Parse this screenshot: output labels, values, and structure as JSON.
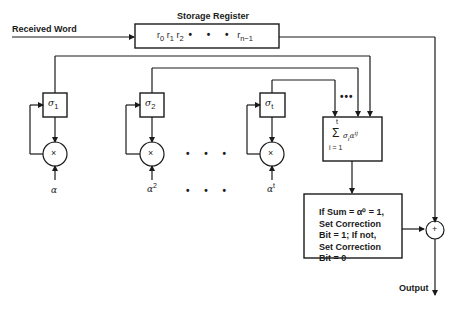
{
  "diagram": {
    "inputs": {
      "received_word": "Received Word",
      "output": "Output"
    },
    "storage_register": {
      "title": "Storage Register",
      "content": {
        "r0": "r",
        "r0_sub": "0",
        "r1": "r",
        "r1_sub": "1",
        "r2": "r",
        "r2_sub": "2",
        "ellipsis": "• • •",
        "rn": "r",
        "rn_sub": "n−1"
      }
    },
    "sigma_blocks": [
      {
        "symbol": "σ",
        "sub": "1",
        "multiplier": "×",
        "alpha": "α",
        "alpha_sup": ""
      },
      {
        "symbol": "σ",
        "sub": "2",
        "multiplier": "×",
        "alpha": "α",
        "alpha_sup": "2"
      },
      {
        "symbol": "σ",
        "sub": "t",
        "multiplier": "×",
        "alpha": "α",
        "alpha_sup": "t"
      }
    ],
    "ellipsis_middle": "• • •",
    "ellipsis_bottom": "• • •",
    "ellipsis_top": "•••",
    "sum_block": {
      "upper_limit": "t",
      "sigma": "Σ",
      "term": "σ",
      "term_sub": "i",
      "term_base": "α",
      "term_sup": "ij",
      "lower_limit": "i = 1"
    },
    "decision_block": {
      "lines": [
        "If Sum = α⁰ = 1,",
        "Set Correction",
        "Bit = 1; If not,",
        "Set Correction",
        "Bit = 0"
      ]
    },
    "adder": {
      "symbol": "+"
    }
  }
}
